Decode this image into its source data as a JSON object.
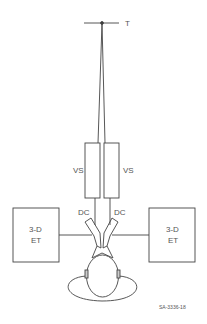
{
  "diagram": {
    "target_label": "T",
    "left_vs_label": "VS",
    "right_vs_label": "VS",
    "left_dc_label": "DC",
    "right_dc_label": "DC",
    "left_et_label_line1": "3-D",
    "left_et_label_line2": "ET",
    "right_et_label_line1": "3-D",
    "right_et_label_line2": "ET",
    "figure_id": "SA-3336-18"
  },
  "colors": {
    "stroke": "#444444",
    "text": "#555555",
    "background": "#ffffff"
  }
}
